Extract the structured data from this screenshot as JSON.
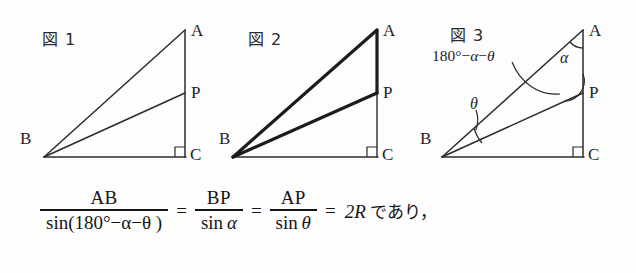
{
  "page": {
    "background_color": "#fdfdfd",
    "ink_color": "#1f1f1f"
  },
  "figures": [
    {
      "id": "figure-1",
      "caption": "図 1",
      "vertices": {
        "A": "A",
        "B": "B",
        "C": "C",
        "P": "P"
      },
      "right_angle_at": "C",
      "emphasis": "none"
    },
    {
      "id": "figure-2",
      "caption": "図 2",
      "vertices": {
        "A": "A",
        "B": "B",
        "C": "C",
        "P": "P"
      },
      "right_angle_at": "C",
      "emphasis": "triangle-ABP-bold"
    },
    {
      "id": "figure-3",
      "caption": "図 3",
      "vertices": {
        "A": "A",
        "B": "B",
        "C": "C",
        "P": "P"
      },
      "right_angle_at": "C",
      "angle_labels": {
        "at_A": "α",
        "at_B": "θ",
        "at_P_prefix": "180°−",
        "at_P_alpha": "α",
        "at_P_minus": "−",
        "at_P_theta": "θ"
      }
    }
  ],
  "formula": {
    "frac1": {
      "numerator": "AB",
      "denominator_fn": "sin",
      "denominator_arg": "(180°−α−θ )"
    },
    "eq1": "=",
    "frac2": {
      "numerator": "BP",
      "denominator_fn": "sin",
      "denominator_arg": "α"
    },
    "eq2": "=",
    "frac3": {
      "numerator": "AP",
      "denominator_fn": "sin",
      "denominator_arg": "θ"
    },
    "eq3": "=",
    "result": "2R",
    "trailing_text": "であり，"
  }
}
